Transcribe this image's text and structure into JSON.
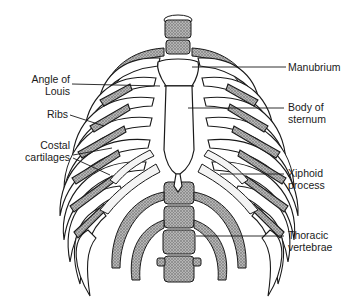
{
  "diagram": {
    "colors": {
      "ink": "#1a1a1a",
      "shade": "#8c8c8c",
      "bone": "#ffffff"
    },
    "labels_left": [
      {
        "id": "angle-of-louis",
        "text": "Angle of\nLouis"
      },
      {
        "id": "ribs",
        "text": "Ribs"
      },
      {
        "id": "costal-cartilages",
        "text": "Costal\ncartilages"
      }
    ],
    "labels_right": [
      {
        "id": "manubrium",
        "text": "Manubrium"
      },
      {
        "id": "body-of-sternum",
        "text": "Body of\nsternum"
      },
      {
        "id": "xiphoid-process",
        "text": "Xiphoid\nprocess"
      },
      {
        "id": "thoracic-vertebrae",
        "text": "Thoracic\nvertebrae"
      }
    ]
  }
}
